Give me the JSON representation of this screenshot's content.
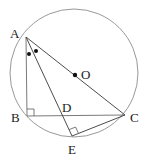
{
  "figure": {
    "kind": "circle-geometry-diagram",
    "width": 149,
    "height": 158,
    "background_color": "#ffffff",
    "stroke_color": "#4d4d4d",
    "circle_stroke_color": "#8c8c8c",
    "label_color": "#1a1a1a",
    "marker_color": "#111111"
  },
  "circle": {
    "name": "circumscribed-circle",
    "center_x": 74,
    "center_y": 73,
    "radius": 64
  },
  "points": {
    "A": {
      "label": "A",
      "x": 26,
      "y": 37,
      "label_x": 10,
      "label_y": 27,
      "on_circle": true
    },
    "B": {
      "label": "B",
      "x": 27,
      "y": 116,
      "label_x": 11,
      "label_y": 111,
      "on_circle": false
    },
    "C": {
      "label": "C",
      "x": 125,
      "y": 115,
      "label_x": 130,
      "label_y": 111,
      "on_circle": true
    },
    "D": {
      "label": "D",
      "x": 63,
      "y": 116,
      "label_x": 62,
      "label_y": 101,
      "on_circle": false
    },
    "E": {
      "label": "E",
      "x": 72,
      "y": 136,
      "label_x": 68,
      "label_y": 143,
      "on_circle": true
    },
    "O": {
      "label": "O",
      "x": 75,
      "y": 75,
      "label_x": 81,
      "label_y": 68,
      "on_circle": false
    }
  },
  "segments": [
    {
      "name": "segment-AB",
      "from": "A",
      "to": "B"
    },
    {
      "name": "segment-AC",
      "from": "A",
      "to": "C"
    },
    {
      "name": "segment-AE",
      "from": "A",
      "to": "E"
    },
    {
      "name": "segment-BC",
      "from": "B",
      "to": "C"
    },
    {
      "name": "segment-EC",
      "from": "E",
      "to": "C"
    }
  ],
  "right_angles": [
    {
      "name": "right-angle-at-B",
      "vertex": "B",
      "size": 7
    },
    {
      "name": "right-angle-at-E",
      "vertex": "E",
      "size": 7
    }
  ],
  "angle_markers": [
    {
      "name": "angle-dot-BAE",
      "x": 29,
      "y": 54,
      "radius": 2
    },
    {
      "name": "angle-dot-EAC",
      "x": 36,
      "y": 51,
      "radius": 2
    }
  ],
  "center_dot": {
    "name": "center-dot-O",
    "x": 75,
    "y": 75,
    "radius": 2.2
  }
}
